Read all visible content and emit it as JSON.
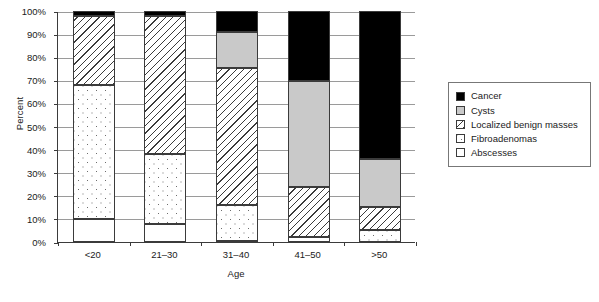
{
  "chart_data": {
    "type": "bar",
    "subtype": "stacked-bar-100-percent",
    "title": "",
    "xlabel": "Age",
    "ylabel": "Percent",
    "categories": [
      "<20",
      "21–30",
      "31–40",
      "41–50",
      ">50"
    ],
    "ylim": [
      0,
      100
    ],
    "ytick_labels": [
      "0%",
      "10%",
      "20%",
      "30%",
      "40%",
      "50%",
      "60%",
      "70%",
      "80%",
      "90%",
      "100%"
    ],
    "ytick_values": [
      0,
      10,
      20,
      30,
      40,
      50,
      60,
      70,
      80,
      90,
      100
    ],
    "grid": true,
    "grid_axis": "y",
    "legend_position": "right",
    "stack_order_bottom_to_top": [
      "Abscesses",
      "Fibroadenomas",
      "Localized benign masses",
      "Cysts",
      "Cancer"
    ],
    "series": [
      {
        "name": "Abscesses",
        "values": [
          10,
          8,
          0.5,
          2,
          0
        ],
        "color": "#ffffff",
        "pattern": "solid-white"
      },
      {
        "name": "Fibroadenomas",
        "values": [
          58,
          30,
          15.5,
          0,
          5
        ],
        "color": "#ffffff",
        "pattern": "dotted"
      },
      {
        "name": "Localized benign masses",
        "values": [
          30,
          60,
          59.5,
          22,
          10
        ],
        "color": "#ffffff",
        "pattern": "diagonal-hatch"
      },
      {
        "name": "Cysts",
        "values": [
          0,
          0,
          15.5,
          45.5,
          21
        ],
        "color": "#c9c9c9",
        "pattern": "solid-gray"
      },
      {
        "name": "Cancer",
        "values": [
          2,
          2,
          9,
          30.5,
          64
        ],
        "color": "#000000",
        "pattern": "solid-black"
      }
    ]
  },
  "axes": {
    "y_title": "Percent",
    "x_title": "Age"
  },
  "legend": {
    "items": [
      {
        "label": "Cancer",
        "swatch": "solid-black"
      },
      {
        "label": "Cysts",
        "swatch": "solid-gray"
      },
      {
        "label": "Localized benign masses",
        "swatch": "diagonal-hatch"
      },
      {
        "label": "Fibroadenomas",
        "swatch": "dotted"
      },
      {
        "label": "Abscesses",
        "swatch": "solid-white"
      }
    ]
  },
  "colors": {
    "cancer": "#000000",
    "cysts": "#c9c9c9",
    "outline": "#3b3b3b",
    "gridline": "#9a9a9a",
    "background": "#ffffff"
  }
}
